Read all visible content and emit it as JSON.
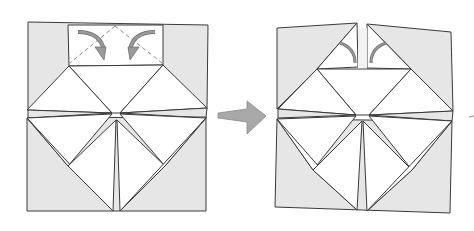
{
  "diagram": {
    "title": "Origami folding step",
    "colors": {
      "paper_back": "#e6e6e6",
      "paper_front": "#ffffff",
      "line": "#3a3a3a",
      "arrow": "#9a9a9a",
      "fold_line": "#8a8a8a"
    },
    "steps": [
      {
        "id": "before",
        "label": "Fold top corners down along dashed lines",
        "fold_type": "valley-fold",
        "arrows": [
          "curved-arrow-left-down",
          "curved-arrow-right-down"
        ]
      },
      {
        "id": "after",
        "label": "Result after folding corners",
        "marks": [
          "fold-mark-left",
          "fold-mark-right"
        ]
      }
    ],
    "transition_arrow": "right-arrow"
  }
}
